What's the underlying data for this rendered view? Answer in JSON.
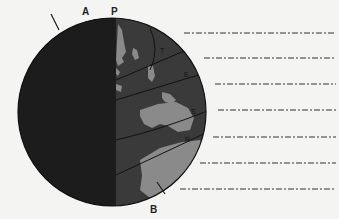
{
  "diagram": {
    "title": "",
    "labels": {
      "A": "A",
      "P": "P",
      "B": "B",
      "T": "T",
      "E": "E",
      "S": "S",
      "R": "R"
    },
    "answer_blanks": [
      {
        "index": 1,
        "text": ""
      },
      {
        "index": 2,
        "text": ""
      },
      {
        "index": 3,
        "text": ""
      },
      {
        "index": 4,
        "text": ""
      },
      {
        "index": 5,
        "text": ""
      },
      {
        "index": 6,
        "text": ""
      },
      {
        "index": 7,
        "text": ""
      }
    ],
    "colors": {
      "night_side": "#1c1c1c",
      "day_side_ocean": "#3a3a3a",
      "land": "#8a8a8a",
      "background": "#f4f4f2",
      "lines": "#222222"
    }
  }
}
